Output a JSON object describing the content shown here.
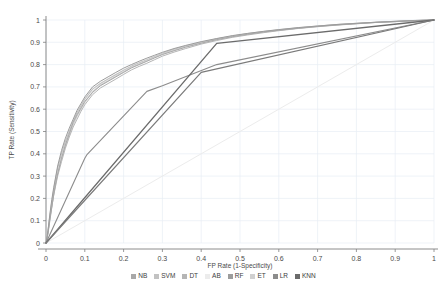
{
  "chart_data": {
    "type": "line",
    "title": "",
    "xlabel": "FP Rate (1-Specificity)",
    "ylabel": "TP Rate (Sensitivity)",
    "xlim": [
      0,
      1
    ],
    "ylim": [
      0,
      1
    ],
    "grid": true,
    "legend_position": "bottom",
    "xticks": [
      "0",
      "0.1",
      "0.2",
      "0.3",
      "0.4",
      "0.5",
      "0.6",
      "0.7",
      "0.8",
      "0.9",
      "1"
    ],
    "yticks": [
      "0",
      "0.1",
      "0.2",
      "0.3",
      "0.4",
      "0.5",
      "0.6",
      "0.7",
      "0.8",
      "0.9",
      "1"
    ],
    "series": [
      {
        "name": "NB",
        "color": "#a8a8a8",
        "width": 1.0,
        "points": [
          [
            0,
            0
          ],
          [
            0.005,
            0.04
          ],
          [
            0.01,
            0.1
          ],
          [
            0.015,
            0.16
          ],
          [
            0.02,
            0.22
          ],
          [
            0.025,
            0.27
          ],
          [
            0.03,
            0.31
          ],
          [
            0.04,
            0.38
          ],
          [
            0.05,
            0.44
          ],
          [
            0.06,
            0.49
          ],
          [
            0.07,
            0.54
          ],
          [
            0.08,
            0.575
          ],
          [
            0.09,
            0.605
          ],
          [
            0.1,
            0.635
          ],
          [
            0.12,
            0.675
          ],
          [
            0.14,
            0.705
          ],
          [
            0.16,
            0.725
          ],
          [
            0.18,
            0.745
          ],
          [
            0.2,
            0.765
          ],
          [
            0.22,
            0.785
          ],
          [
            0.24,
            0.8
          ],
          [
            0.26,
            0.815
          ],
          [
            0.28,
            0.83
          ],
          [
            0.3,
            0.845
          ],
          [
            0.33,
            0.862
          ],
          [
            0.36,
            0.878
          ],
          [
            0.4,
            0.896
          ],
          [
            0.44,
            0.912
          ],
          [
            0.48,
            0.925
          ],
          [
            0.52,
            0.936
          ],
          [
            0.56,
            0.946
          ],
          [
            0.6,
            0.954
          ],
          [
            0.65,
            0.963
          ],
          [
            0.7,
            0.971
          ],
          [
            0.75,
            0.978
          ],
          [
            0.8,
            0.984
          ],
          [
            0.85,
            0.989
          ],
          [
            0.9,
            0.993
          ],
          [
            0.95,
            0.997
          ],
          [
            1,
            1
          ]
        ]
      },
      {
        "name": "SVM",
        "color": "#c2c2c2",
        "width": 1.2,
        "points": [
          [
            0,
            0
          ],
          [
            0.005,
            0.05
          ],
          [
            0.01,
            0.12
          ],
          [
            0.015,
            0.185
          ],
          [
            0.02,
            0.24
          ],
          [
            0.03,
            0.335
          ],
          [
            0.04,
            0.4
          ],
          [
            0.05,
            0.455
          ],
          [
            0.06,
            0.5
          ],
          [
            0.07,
            0.545
          ],
          [
            0.08,
            0.585
          ],
          [
            0.09,
            0.615
          ],
          [
            0.1,
            0.645
          ],
          [
            0.12,
            0.69
          ],
          [
            0.14,
            0.715
          ],
          [
            0.16,
            0.735
          ],
          [
            0.18,
            0.755
          ],
          [
            0.2,
            0.775
          ],
          [
            0.22,
            0.793
          ],
          [
            0.24,
            0.808
          ],
          [
            0.26,
            0.822
          ],
          [
            0.28,
            0.836
          ],
          [
            0.3,
            0.85
          ],
          [
            0.33,
            0.868
          ],
          [
            0.36,
            0.883
          ],
          [
            0.4,
            0.9
          ],
          [
            0.44,
            0.915
          ],
          [
            0.48,
            0.928
          ],
          [
            0.52,
            0.939
          ],
          [
            0.56,
            0.948
          ],
          [
            0.6,
            0.956
          ],
          [
            0.65,
            0.965
          ],
          [
            0.7,
            0.973
          ],
          [
            0.75,
            0.979
          ],
          [
            0.8,
            0.985
          ],
          [
            0.85,
            0.99
          ],
          [
            0.9,
            0.994
          ],
          [
            0.95,
            0.997
          ],
          [
            1,
            1
          ]
        ]
      },
      {
        "name": "DT",
        "color": "#b5b5b5",
        "width": 1.0,
        "points": [
          [
            0,
            0
          ],
          [
            0.005,
            0.045
          ],
          [
            0.01,
            0.11
          ],
          [
            0.02,
            0.215
          ],
          [
            0.03,
            0.3
          ],
          [
            0.04,
            0.365
          ],
          [
            0.05,
            0.425
          ],
          [
            0.06,
            0.475
          ],
          [
            0.07,
            0.52
          ],
          [
            0.08,
            0.555
          ],
          [
            0.09,
            0.59
          ],
          [
            0.1,
            0.62
          ],
          [
            0.12,
            0.665
          ],
          [
            0.14,
            0.695
          ],
          [
            0.16,
            0.715
          ],
          [
            0.18,
            0.735
          ],
          [
            0.2,
            0.756
          ],
          [
            0.22,
            0.776
          ],
          [
            0.24,
            0.792
          ],
          [
            0.26,
            0.806
          ],
          [
            0.28,
            0.822
          ],
          [
            0.3,
            0.838
          ],
          [
            0.33,
            0.856
          ],
          [
            0.36,
            0.872
          ],
          [
            0.4,
            0.892
          ],
          [
            0.44,
            0.908
          ],
          [
            0.48,
            0.922
          ],
          [
            0.52,
            0.933
          ],
          [
            0.56,
            0.943
          ],
          [
            0.6,
            0.952
          ],
          [
            0.65,
            0.962
          ],
          [
            0.7,
            0.97
          ],
          [
            0.75,
            0.977
          ],
          [
            0.8,
            0.983
          ],
          [
            0.85,
            0.989
          ],
          [
            0.9,
            0.993
          ],
          [
            0.95,
            0.997
          ],
          [
            1,
            1
          ]
        ]
      },
      {
        "name": "AB",
        "color": "#ececec",
        "width": 1.0,
        "points": [
          [
            0,
            0
          ],
          [
            1,
            1
          ]
        ]
      },
      {
        "name": "RF",
        "color": "#9c9c9c",
        "width": 1.0,
        "points": [
          [
            0,
            0
          ],
          [
            0.005,
            0.055
          ],
          [
            0.01,
            0.13
          ],
          [
            0.015,
            0.195
          ],
          [
            0.02,
            0.25
          ],
          [
            0.03,
            0.345
          ],
          [
            0.04,
            0.415
          ],
          [
            0.05,
            0.47
          ],
          [
            0.06,
            0.515
          ],
          [
            0.07,
            0.555
          ],
          [
            0.08,
            0.595
          ],
          [
            0.09,
            0.625
          ],
          [
            0.1,
            0.655
          ],
          [
            0.12,
            0.7
          ],
          [
            0.14,
            0.725
          ],
          [
            0.16,
            0.745
          ],
          [
            0.18,
            0.765
          ],
          [
            0.2,
            0.784
          ],
          [
            0.22,
            0.8
          ],
          [
            0.24,
            0.815
          ],
          [
            0.26,
            0.829
          ],
          [
            0.28,
            0.842
          ],
          [
            0.3,
            0.855
          ],
          [
            0.33,
            0.872
          ],
          [
            0.36,
            0.886
          ],
          [
            0.4,
            0.903
          ],
          [
            0.44,
            0.917
          ],
          [
            0.48,
            0.93
          ],
          [
            0.52,
            0.94
          ],
          [
            0.56,
            0.949
          ],
          [
            0.6,
            0.957
          ],
          [
            0.65,
            0.966
          ],
          [
            0.7,
            0.973
          ],
          [
            0.75,
            0.98
          ],
          [
            0.8,
            0.985
          ],
          [
            0.85,
            0.99
          ],
          [
            0.9,
            0.994
          ],
          [
            0.95,
            0.998
          ],
          [
            1,
            1
          ]
        ]
      },
      {
        "name": "ET",
        "color": "#d0d0d0",
        "width": 1.2,
        "points": [
          [
            0,
            0
          ],
          [
            0.005,
            0.05
          ],
          [
            0.01,
            0.115
          ],
          [
            0.02,
            0.22
          ],
          [
            0.03,
            0.31
          ],
          [
            0.04,
            0.38
          ],
          [
            0.05,
            0.435
          ],
          [
            0.06,
            0.485
          ],
          [
            0.07,
            0.53
          ],
          [
            0.08,
            0.57
          ],
          [
            0.09,
            0.6
          ],
          [
            0.1,
            0.63
          ],
          [
            0.12,
            0.678
          ],
          [
            0.14,
            0.708
          ],
          [
            0.16,
            0.728
          ],
          [
            0.18,
            0.748
          ],
          [
            0.2,
            0.768
          ],
          [
            0.22,
            0.788
          ],
          [
            0.24,
            0.803
          ],
          [
            0.26,
            0.818
          ],
          [
            0.28,
            0.833
          ],
          [
            0.3,
            0.848
          ],
          [
            0.33,
            0.865
          ],
          [
            0.36,
            0.88
          ],
          [
            0.4,
            0.898
          ],
          [
            0.44,
            0.913
          ],
          [
            0.48,
            0.927
          ],
          [
            0.52,
            0.937
          ],
          [
            0.56,
            0.947
          ],
          [
            0.6,
            0.955
          ],
          [
            0.65,
            0.964
          ],
          [
            0.7,
            0.972
          ],
          [
            0.75,
            0.979
          ],
          [
            0.8,
            0.984
          ],
          [
            0.85,
            0.989
          ],
          [
            0.9,
            0.993
          ],
          [
            0.95,
            0.997
          ],
          [
            1,
            1
          ]
        ]
      },
      {
        "name": "LR",
        "color": "#8c8c8c",
        "width": 1.1,
        "points": [
          [
            0,
            0
          ],
          [
            0.1,
            0.38
          ],
          [
            0.105,
            0.395
          ],
          [
            0.26,
            0.68
          ],
          [
            0.3,
            0.705
          ],
          [
            0.44,
            0.8
          ],
          [
            1,
            1
          ]
        ]
      },
      {
        "name": "KNN",
        "color": "#6b6b6b",
        "width": 1.3,
        "points": [
          [
            0,
            0
          ],
          [
            0.44,
            0.895
          ],
          [
            1,
            1
          ]
        ]
      }
    ],
    "secondary_lines": [
      {
        "name": "knn-lower-segment",
        "color": "#7a7a7a",
        "width": 1.2,
        "points": [
          [
            0,
            0
          ],
          [
            0.4,
            0.765
          ],
          [
            1,
            1
          ]
        ]
      }
    ]
  },
  "legend": {
    "items": [
      {
        "label": "NB",
        "color": "#a8a8a8"
      },
      {
        "label": "SVM",
        "color": "#c2c2c2"
      },
      {
        "label": "DT",
        "color": "#b5b5b5"
      },
      {
        "label": "AB",
        "color": "#ececec"
      },
      {
        "label": "RF",
        "color": "#9c9c9c"
      },
      {
        "label": "ET",
        "color": "#d0d0d0"
      },
      {
        "label": "LR",
        "color": "#8c8c8c"
      },
      {
        "label": "KNN",
        "color": "#6b6b6b"
      }
    ]
  },
  "style": {
    "grid_color": "#e8eef5",
    "axis_color": "#808080",
    "text_color": "#4a4a4a",
    "background": "#ffffff"
  }
}
